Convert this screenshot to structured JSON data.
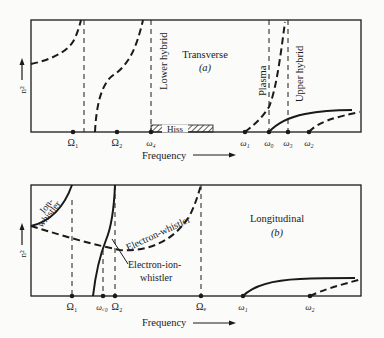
{
  "panel_a": {
    "title": "Transverse",
    "subtitle": "(a)",
    "y_axis_label": "n²",
    "x_axis_label": "Frequency",
    "resonance_labels": {
      "lower_hybrid": "Lower hybrid",
      "plasma": "Plasma",
      "upper_hybrid": "Upper hybrid"
    },
    "band_label": "Hiss",
    "ticks": [
      "Ω₁",
      "Ω₂",
      "ω₄",
      "ω₁",
      "ω₀",
      "ω₃",
      "ω₂"
    ]
  },
  "panel_b": {
    "title": "Longitudinal",
    "subtitle": "(b)",
    "y_axis_label": "n²",
    "x_axis_label": "Frequency",
    "curve_labels": {
      "ion_whistler_1": "Ion-",
      "ion_whistler_2": "whistler",
      "electron_whistler": "Electron-whistler",
      "electron_ion_whistler_1": "Electron-ion-",
      "electron_ion_whistler_2": "whistler"
    },
    "ticks": [
      "Ω₁",
      "ω꜀₀",
      "Ω₂",
      "Ωₑ",
      "ω₁",
      "ω₂"
    ]
  }
}
